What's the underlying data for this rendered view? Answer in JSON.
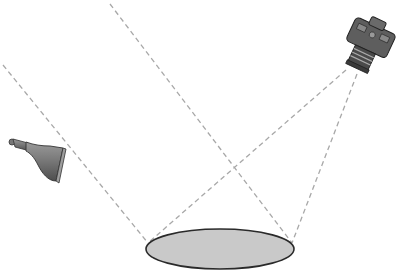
{
  "diagram": {
    "colors": {
      "background": "#ffffff",
      "ray": "#a8a8a8",
      "surface_fill": "#c9c9c9",
      "surface_stroke": "#2a2a2a",
      "device_body": "#6e6e6e"
    },
    "elements": {
      "lamp": {
        "label": "light-source",
        "icon": "lamp-icon"
      },
      "camera": {
        "label": "camera",
        "icon": "camera-icon"
      },
      "surface": {
        "label": "surface-patch",
        "shape": "ellipse"
      }
    },
    "rays": [
      {
        "name": "illumination-ray-left",
        "from": [
          3,
          65
        ],
        "to": [
          148,
          243
        ]
      },
      {
        "name": "illumination-ray-right",
        "from": [
          110,
          4
        ],
        "to": [
          292,
          243
        ]
      },
      {
        "name": "view-ray-left",
        "from": [
          346,
          70
        ],
        "to": [
          148,
          243
        ]
      },
      {
        "name": "view-ray-right",
        "from": [
          357,
          74
        ],
        "to": [
          292,
          243
        ]
      }
    ]
  }
}
